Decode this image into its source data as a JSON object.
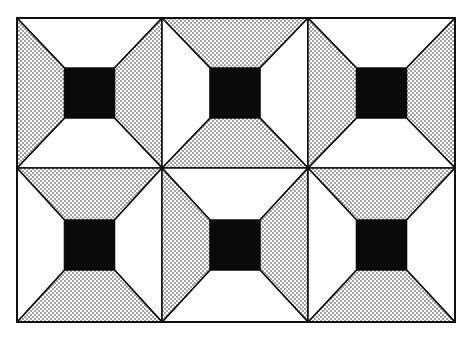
{
  "figure": {
    "type": "quilt-block-pattern",
    "grid": {
      "x_lines": [
        17,
        162,
        308,
        455
      ],
      "y_lines": [
        18,
        168,
        322
      ]
    },
    "colors": {
      "background": "#ffffff",
      "line": "#111111",
      "center_square": "#0a0a0a",
      "dot": "#1a1a1a"
    },
    "center_square_size": 50,
    "tiles": [
      {
        "row": 0,
        "col": 0,
        "dotted": "left-right"
      },
      {
        "row": 0,
        "col": 1,
        "dotted": "top-bottom"
      },
      {
        "row": 0,
        "col": 2,
        "dotted": "left-right"
      },
      {
        "row": 1,
        "col": 0,
        "dotted": "top-bottom"
      },
      {
        "row": 1,
        "col": 1,
        "dotted": "left-right"
      },
      {
        "row": 1,
        "col": 2,
        "dotted": "top-bottom"
      }
    ]
  }
}
